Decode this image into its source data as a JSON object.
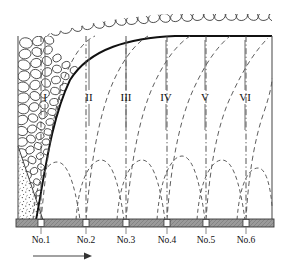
{
  "figure": {
    "type": "geotechnical-cross-section-diagram",
    "title": "",
    "background_color": "#ffffff",
    "line_color": "#111111",
    "fill_bar_color": "#8c8c8c",
    "arrow_color": "#333333"
  },
  "frame": {
    "left_x": 18,
    "right_x": 272,
    "top_y": 36,
    "base_y": 220,
    "base_bar_height": 8
  },
  "zones": {
    "label_y": 98,
    "items": [
      {
        "label": "I",
        "x": 45
      },
      {
        "label": "II",
        "x": 89
      },
      {
        "label": "III",
        "x": 126
      },
      {
        "label": "IV",
        "x": 166
      },
      {
        "label": "V",
        "x": 205
      },
      {
        "label": "VI",
        "x": 245
      }
    ]
  },
  "stations": {
    "label_y": 240,
    "items": [
      {
        "label": "No.1",
        "x": 41
      },
      {
        "label": "No.2",
        "x": 86
      },
      {
        "label": "No.3",
        "x": 126
      },
      {
        "label": "No.4",
        "x": 167
      },
      {
        "label": "No.5",
        "x": 206
      },
      {
        "label": "No.6",
        "x": 246
      }
    ]
  },
  "direction_arrow": {
    "name": "advance-direction-arrow",
    "x_start": 33,
    "x_end": 90,
    "y": 255,
    "points": "right"
  },
  "caving_boundary": {
    "name": "caving-boundary-curve",
    "path": "M 36 220 C 44 180 52 120 70 78 C 90 48 130 38 175 36 L 272 36"
  },
  "sand_wedge": {
    "name": "stippled-sand-wedge",
    "path": "M 18 220 L 18 150 L 42 220 Z",
    "pattern": "stipple-dots"
  },
  "cobble_fill": {
    "name": "cobble-rock-fill",
    "pattern": "ellipses",
    "note": "rounded boulder / cobble outlines filling the caved zone and capping the top"
  },
  "dashdot_lines": {
    "name": "dash-dot-vertical-lines",
    "x_positions": [
      41,
      86,
      126,
      167,
      206,
      246
    ],
    "dasharray": "6,2.5,1.2,2.5"
  },
  "zone_leader_lines": {
    "name": "zone-leader-lines",
    "x_positions": [
      45,
      89,
      126,
      166,
      205,
      245
    ],
    "top_y": 40,
    "bottom_y": 112
  },
  "dashed_sweeps": {
    "name": "dashed-fracture-sweep-curves",
    "count": 6,
    "dasharray": "5,3.5"
  },
  "dashed_arches": {
    "name": "dashed-arch-curves",
    "count": 6,
    "dasharray": "4,3",
    "baseline_y": 220,
    "crest_y": 160
  }
}
